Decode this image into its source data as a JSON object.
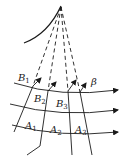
{
  "diagram": {
    "colors": {
      "stroke": "#1a1a1a",
      "background": "#ffffff"
    },
    "labels": {
      "B1": {
        "base": "B",
        "sub": "1"
      },
      "B2": {
        "base": "B",
        "sub": "2"
      },
      "B3": {
        "base": "B",
        "sub": "3"
      },
      "beta": {
        "text": "β"
      },
      "A1": {
        "base": "A",
        "sub": "1"
      },
      "A2": {
        "base": "A",
        "sub": "2"
      },
      "A3": {
        "base": "A",
        "sub": "3"
      }
    }
  }
}
